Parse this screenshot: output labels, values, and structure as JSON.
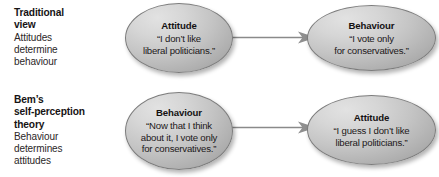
{
  "diagram": {
    "background_color": "#ffffff",
    "node_fill_light": "#e2e2e2",
    "node_fill_dark": "#8f8f8f",
    "node_border_color": "#7c7c7c",
    "arrow_color": "#8a8a8a",
    "text_color": "#1a1718"
  },
  "rows": [
    {
      "label": {
        "heading_line1": "Traditional",
        "heading_line2": "view",
        "sub_line1": "Attitudes",
        "sub_line2": "determine",
        "sub_line3": "behaviour"
      },
      "cause": {
        "title": "Attitude",
        "quote": "“I don’t like\nliberal politicians.”"
      },
      "effect": {
        "title": "Behaviour",
        "quote": "“I vote only\nfor conservatives.”"
      },
      "arrow": {
        "direction": "right",
        "label": ""
      }
    },
    {
      "label": {
        "heading_line1": "Bem’s",
        "heading_line2": "self-perception",
        "heading_line3": "theory",
        "sub_line1": "Behaviour",
        "sub_line2": "determines",
        "sub_line3": "attitudes"
      },
      "cause": {
        "title": "Behaviour",
        "quote": "“Now that I think\nabout it, I vote only\nfor conservatives.”"
      },
      "effect": {
        "title": "Attitude",
        "quote": "“I guess I don’t like\nliberal politicians.”"
      },
      "arrow": {
        "direction": "right",
        "label": ""
      }
    }
  ]
}
